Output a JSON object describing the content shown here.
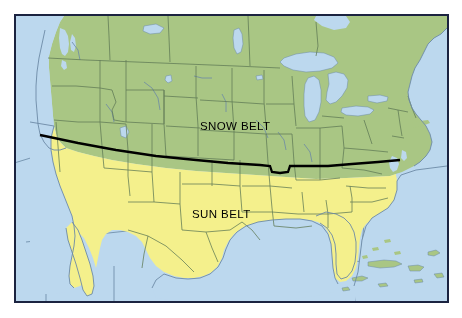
{
  "figure": {
    "kind": "thematic-map",
    "region": "United States",
    "frame": {
      "border_color": "#1b2340",
      "border_width_px": 2,
      "margin_px": 14,
      "background_color": "#ffffff"
    }
  },
  "legend_colors": {
    "snow_belt_fill": "#a9c684",
    "sun_belt_fill": "#f4f08c",
    "water_fill": "#bcd8ee",
    "boundary_line": "#5f7a56",
    "coastline": "#6d8aa6",
    "graticule": "#4a6b8a",
    "divider_line": "#000000",
    "label_color": "#000000"
  },
  "labels": [
    {
      "id": "snow-belt",
      "text": "SNOW BELT",
      "x": 184,
      "y": 104
    },
    {
      "id": "sun-belt",
      "text": "SUN BELT",
      "x": 176,
      "y": 192
    }
  ],
  "regions": {
    "snow_belt": {
      "name": "SNOW BELT",
      "fill": "#a9c684",
      "position": "north of divider"
    },
    "sun_belt": {
      "name": "SUN BELT",
      "fill": "#f4f08c",
      "position": "south of divider"
    }
  },
  "divider": {
    "description": "thick black line separating Snow Belt from Sun Belt",
    "color": "#000000",
    "width_px": 2.2
  }
}
